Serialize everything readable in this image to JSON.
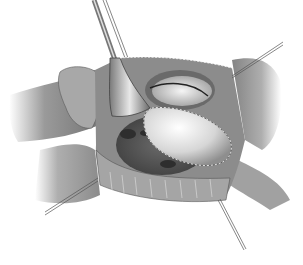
{
  "image": {
    "width": 303,
    "height": 265,
    "style": "grayscale surgical illustration",
    "subject": "open cardiac surgical field with retractor, stay sutures and oval patch",
    "elements": [
      {
        "name": "retractor",
        "description": "handheld blade retractor entering from top"
      },
      {
        "name": "patch",
        "description": "oval patch sutured along dashed line"
      },
      {
        "name": "upper-opening",
        "description": "elliptical opening with white tissue"
      },
      {
        "name": "stay-sutures",
        "count": 4
      },
      {
        "name": "lower-cavity",
        "description": "dark cavity with openings"
      }
    ],
    "colors": {
      "background": "#ffffff",
      "tissue_dark": "#5a5a5a",
      "tissue_mid": "#8c8c8c",
      "tissue_light": "#c8c8c8",
      "highlight": "#f2f2f2"
    }
  }
}
